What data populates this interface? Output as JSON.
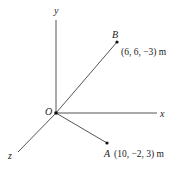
{
  "diagram": {
    "type": "3d-coordinate-axes",
    "origin": {
      "label": "O"
    },
    "axes": {
      "x": {
        "label": "x"
      },
      "y": {
        "label": "y"
      },
      "z": {
        "label": "z"
      }
    },
    "points": [
      {
        "name": "B",
        "coords": "(6, 6, −3) m"
      },
      {
        "name": "A",
        "coords": "(10, −2, 3) m"
      }
    ],
    "colors": {
      "line": "#555555",
      "text": "#222222",
      "point": "#111111"
    }
  }
}
